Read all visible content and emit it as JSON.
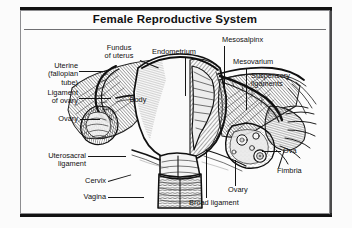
{
  "figure": {
    "title": "Female Reproductive System",
    "kind": "anatomical-illustration",
    "style": "black-and-white engraving / line hatching",
    "colors": {
      "background": "#fbfbfb",
      "frame": "#8d8d90",
      "bar": "#121212",
      "ink": "#141414",
      "text": "#101010"
    }
  },
  "labels": {
    "fundus_of_uterus": "Fundus\nof uterus",
    "uterine_tube": "Uterine\n(fallopian\ntube)",
    "ligament_of_ovary": "Ligament\nof ovary",
    "ovary_left": "Ovary",
    "uterosacral_ligament": "Uterosacral\nligament",
    "cervix": "Cervix",
    "vagina": "Vagina",
    "endometrium": "Endometrium",
    "body": "Body",
    "mesosalpinx": "Mesosalpinx",
    "mesovarium": "Mesovarium",
    "suspensory_ligaments": "Suspensory\nligaments",
    "ova": "Ova",
    "fimbria": "Fimbria",
    "ovary_right": "Ovary",
    "broad_ligament": "Broad ligament"
  },
  "structures": [
    "uterine fundus",
    "uterine body",
    "endometrium",
    "myometrium",
    "cervix",
    "vagina",
    "left uterine (fallopian) tube",
    "right uterine (fallopian) tube",
    "left ovary",
    "right ovary",
    "fimbriae",
    "ova / ovarian follicles",
    "broad ligament",
    "mesosalpinx",
    "mesovarium",
    "suspensory ligament of ovary",
    "ligament of ovary",
    "uterosacral ligament"
  ]
}
